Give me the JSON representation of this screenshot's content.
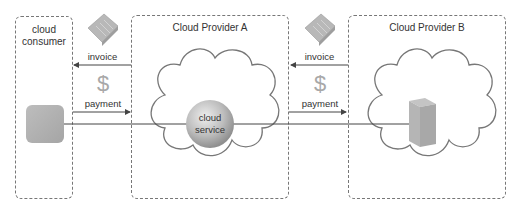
{
  "consumer": {
    "title_line1": "cloud",
    "title_line2": "consumer"
  },
  "provider_a": {
    "title": "Cloud Provider A",
    "service_line1": "cloud",
    "service_line2": "service"
  },
  "provider_b": {
    "title": "Cloud Provider B"
  },
  "flows": [
    {
      "id": "a-to-consumer",
      "invoice_label": "invoice",
      "currency_symbol": "$",
      "payment_label": "payment"
    },
    {
      "id": "b-to-a",
      "invoice_label": "invoice",
      "currency_symbol": "$",
      "payment_label": "payment"
    }
  ],
  "colors": {
    "border": "#777777",
    "line": "#444444",
    "icon_gray": "#b0b0b0",
    "dollar": "#a8a8a8"
  }
}
